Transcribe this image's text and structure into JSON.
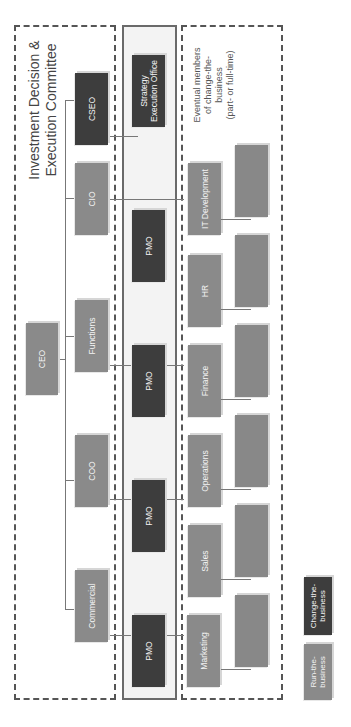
{
  "title": "Investment Decision & Execution Committee",
  "title_lines": [
    "Investment Decision &",
    "Execution Committee"
  ],
  "ceo": {
    "label": "CEO"
  },
  "executives": [
    {
      "label": "Commercial"
    },
    {
      "label": "COO"
    },
    {
      "label": "Functions"
    },
    {
      "label": "CIO"
    },
    {
      "label": "CSEO"
    }
  ],
  "strategy_office": {
    "label_lines": [
      "Strategy",
      "Execution Office"
    ]
  },
  "pmos": [
    {
      "label": "PMO"
    },
    {
      "label": "PMO"
    },
    {
      "label": "PMO"
    },
    {
      "label": "PMO"
    }
  ],
  "note_lines": [
    "Eventual members",
    "of change-the-",
    "business",
    "(part- or full-time)"
  ],
  "departments": [
    {
      "label": "Marketing"
    },
    {
      "label": "Sales"
    },
    {
      "label": "Operations"
    },
    {
      "label": "Finance"
    },
    {
      "label": "HR"
    },
    {
      "label": "IT Development"
    }
  ],
  "legend": {
    "run": {
      "lines": [
        "Run-the-",
        "business"
      ],
      "color": "#8a8a8a"
    },
    "change": {
      "lines": [
        "Change-the-",
        "business"
      ],
      "color": "#3d3d3d"
    }
  },
  "colors": {
    "run_the_business": "#8a8a8a",
    "change_the_business": "#3d3d3d"
  }
}
